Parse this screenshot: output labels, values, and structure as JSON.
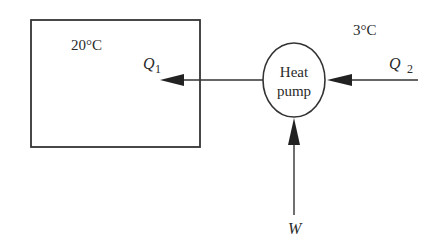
{
  "diagram": {
    "room": {
      "temperature_label": "20°C"
    },
    "outside": {
      "temperature_label": "3°C"
    },
    "device": {
      "label_line1": "Heat",
      "label_line2": "pump"
    },
    "flows": {
      "q1": {
        "symbol": "Q",
        "subscript": "1",
        "direction": "from heat pump to room"
      },
      "q2": {
        "symbol": "Q",
        "subscript": "2",
        "direction": "from outside to heat pump"
      },
      "w": {
        "symbol": "W",
        "direction": "work input to heat pump"
      }
    },
    "colors": {
      "stroke": "#333333",
      "text": "#2a2a2a",
      "background": "#ffffff"
    }
  }
}
